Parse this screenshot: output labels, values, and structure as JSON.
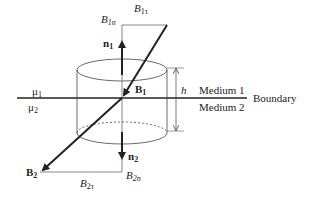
{
  "diagram": {
    "labels": {
      "B1n": {
        "main": "B",
        "sub": "1n"
      },
      "B1t": {
        "main": "B",
        "sub": "1τ"
      },
      "n1": {
        "main": "n",
        "sub": "1"
      },
      "B1": {
        "main": "B",
        "sub": "1"
      },
      "mu1": {
        "main": "μ",
        "sub": "1"
      },
      "mu2": {
        "main": "μ",
        "sub": "2"
      },
      "h": "h",
      "medium1": "Medium 1",
      "medium2": "Medium 2",
      "boundary": "Boundary",
      "n2": {
        "main": "n",
        "sub": "2"
      },
      "B2": {
        "main": "B",
        "sub": "2"
      },
      "B2t": {
        "main": "B",
        "sub": "2τ"
      },
      "B2n": {
        "main": "B",
        "sub": "2n"
      }
    },
    "colors": {
      "line": "#222222",
      "thin": "#555555"
    }
  }
}
